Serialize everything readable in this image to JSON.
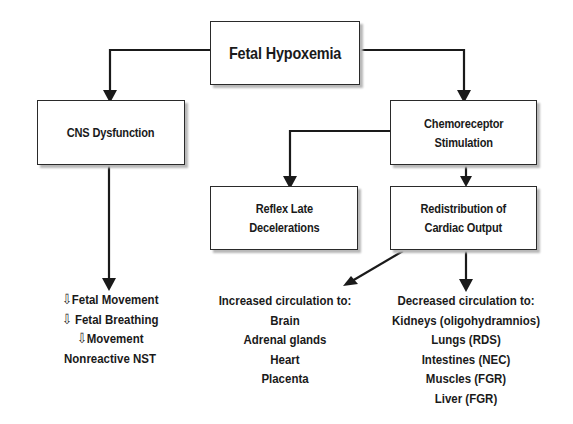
{
  "diagram": {
    "root": {
      "label": "Fetal Hypoxemia"
    },
    "cns": {
      "label": "CNS Dysfunction"
    },
    "chemo": {
      "line1": "Chemoreceptor",
      "line2": "Stimulation"
    },
    "reflex": {
      "line1": "Reflex Late",
      "line2": "Decelerations"
    },
    "redistribution": {
      "line1": "Redistribution of",
      "line2": "Cardiac Output"
    },
    "cns_effects": {
      "arrow_symbol": "⇩",
      "items": [
        "Fetal Movement",
        "Fetal Breathing",
        "Movement",
        "Nonreactive NST"
      ]
    },
    "increased": {
      "heading": "Increased circulation to:",
      "items": [
        "Brain",
        "Adrenal glands",
        "Heart",
        "Placenta"
      ]
    },
    "decreased": {
      "heading": "Decreased circulation to:",
      "items": [
        "Kidneys (oligohydramnios)",
        "Lungs (RDS)",
        "Intestines (NEC)",
        "Muscles (FGR)",
        "Liver (FGR)"
      ]
    }
  },
  "colors": {
    "line": "#1a1a1a",
    "border": "#2a2a2a",
    "shadow": "#b8b8b8",
    "background": "#ffffff"
  }
}
